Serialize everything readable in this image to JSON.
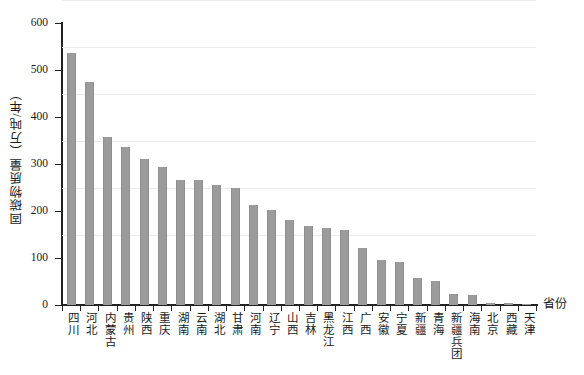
{
  "chart_data": {
    "type": "bar",
    "title": "",
    "xlabel": "省份",
    "ylabel": "固碳物质量（万吨/年）",
    "ylim": [
      0,
      600
    ],
    "yticks": [
      0,
      100,
      200,
      300,
      400,
      500,
      600
    ],
    "grid": true,
    "legend": null,
    "bar_color": "#9b9b9b",
    "categories": [
      "四川",
      "河北",
      "内蒙古",
      "贵州",
      "陕西",
      "重庆",
      "湖南",
      "云南",
      "湖北",
      "甘肃",
      "河南",
      "辽宁",
      "山西",
      "吉林",
      "黑龙江",
      "江西",
      "广西",
      "安徽",
      "宁夏",
      "新疆",
      "青海",
      "新疆兵团",
      "海南",
      "北京",
      "西藏",
      "天津"
    ],
    "values": [
      536,
      475,
      357,
      336,
      310,
      294,
      267,
      266,
      256,
      248,
      213,
      203,
      181,
      168,
      163,
      160,
      122,
      95,
      92,
      58,
      51,
      24,
      21,
      5,
      5,
      2
    ]
  },
  "axes": {
    "y_title": "固碳物质量（万吨/年）",
    "x_title": "省份",
    "y_tick_labels": [
      "600",
      "500",
      "400",
      "300",
      "200",
      "100",
      "0"
    ]
  }
}
